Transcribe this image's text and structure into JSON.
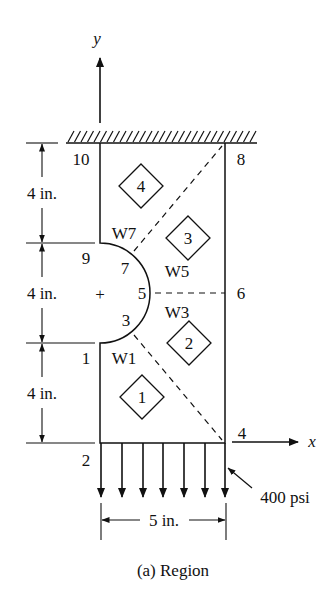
{
  "figure": {
    "caption": "(a) Region",
    "axes": {
      "x_label": "x",
      "y_label": "y"
    },
    "nodes": [
      {
        "id": "1",
        "label": "1"
      },
      {
        "id": "2",
        "label": "2"
      },
      {
        "id": "3",
        "label": "3"
      },
      {
        "id": "4",
        "label": "4"
      },
      {
        "id": "5",
        "label": "5"
      },
      {
        "id": "6",
        "label": "6"
      },
      {
        "id": "7",
        "label": "7"
      },
      {
        "id": "8",
        "label": "8"
      },
      {
        "id": "9",
        "label": "9"
      },
      {
        "id": "10",
        "label": "10"
      }
    ],
    "elements": [
      {
        "label": "1"
      },
      {
        "label": "2"
      },
      {
        "label": "3"
      },
      {
        "label": "4"
      }
    ],
    "weights": [
      "W1",
      "W3",
      "W5",
      "W7"
    ],
    "dimensions": {
      "top": "4 in.",
      "middle": "4 in.",
      "bottom": "4 in.",
      "width": "5 in."
    },
    "load": "400 psi",
    "center_mark": "+",
    "colors": {
      "ink": "#111111",
      "background": "#ffffff"
    }
  }
}
